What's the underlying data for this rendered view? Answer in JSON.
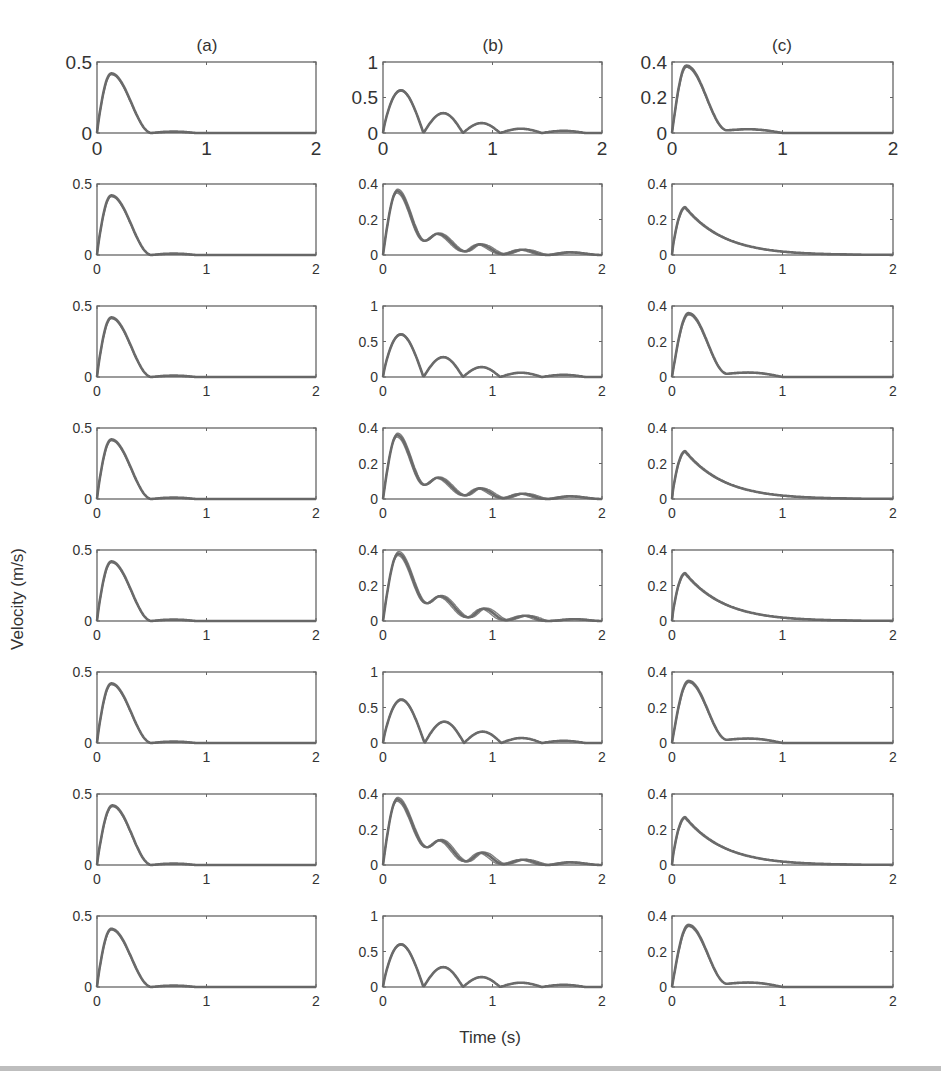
{
  "figure": {
    "column_titles": [
      "(a)",
      "(b)",
      "(c)"
    ],
    "ylabel": "Velocity (m/s)",
    "xlabel": "Time (s)",
    "line_color": "#6b6b6b",
    "axis_color": "#666666",
    "tick_label_color": "#333333"
  },
  "chart_data": {
    "type": "line",
    "layout": "8 rows x 3 columns of small multiples; each panel shows several overlapping velocity traces",
    "xlabel": "Time (s)",
    "ylabel": "Velocity (m/s)",
    "column_titles": [
      "(a)",
      "(b)",
      "(c)"
    ],
    "xlim": [
      0,
      2
    ],
    "xticks": [
      0,
      1,
      2
    ],
    "grid": false,
    "legend": null,
    "panels": [
      {
        "row": 1,
        "col": "a",
        "ylim": [
          0,
          0.5
        ],
        "yticks": [
          0,
          0.5
        ],
        "shape": "single_peak",
        "peak_t": 0.13,
        "peak_v": 0.42,
        "end_t": 0.5,
        "bump_v": 0.01
      },
      {
        "row": 1,
        "col": "b",
        "ylim": [
          0,
          1
        ],
        "yticks": [
          0,
          0.5,
          1
        ],
        "shape": "bouncing",
        "peaks": [
          [
            0.18,
            0.6
          ],
          [
            0.55,
            0.28
          ],
          [
            0.9,
            0.14
          ],
          [
            1.27,
            0.06
          ],
          [
            1.65,
            0.03
          ]
        ],
        "zeros": [
          0,
          0.37,
          0.73,
          1.07,
          1.45,
          1.85
        ]
      },
      {
        "row": 1,
        "col": "c",
        "ylim": [
          0,
          0.4
        ],
        "yticks": [
          0,
          0.2,
          0.4
        ],
        "shape": "peak_with_shoulder",
        "peak_t": 0.13,
        "peak_v": 0.38,
        "shoulder_t": 0.65,
        "shoulder_v": 0.025,
        "end_t": 1.0
      },
      {
        "row": 2,
        "col": "a",
        "ylim": [
          0,
          0.5
        ],
        "yticks": [
          0,
          0.5
        ],
        "shape": "single_peak",
        "peak_t": 0.13,
        "peak_v": 0.42,
        "end_t": 0.5,
        "bump_v": 0.01
      },
      {
        "row": 2,
        "col": "b",
        "ylim": [
          0,
          0.4
        ],
        "yticks": [
          0,
          0.2,
          0.4
        ],
        "shape": "damped_oscillation",
        "peaks": [
          [
            0.13,
            0.36
          ],
          [
            0.5,
            0.12
          ],
          [
            0.88,
            0.06
          ],
          [
            1.27,
            0.03
          ],
          [
            1.7,
            0.015
          ]
        ],
        "troughs": [
          [
            0.38,
            0.08
          ],
          [
            0.75,
            0.02
          ],
          [
            1.1,
            0.005
          ],
          [
            1.5,
            0.0
          ]
        ]
      },
      {
        "row": 2,
        "col": "c",
        "ylim": [
          0,
          0.4
        ],
        "yticks": [
          0,
          0.2,
          0.4
        ],
        "shape": "decay_tail",
        "peak_t": 0.12,
        "peak_v": 0.27,
        "tail_end_t": 1.3
      },
      {
        "row": 3,
        "col": "a",
        "ylim": [
          0,
          0.5
        ],
        "yticks": [
          0,
          0.5
        ],
        "shape": "single_peak",
        "peak_t": 0.13,
        "peak_v": 0.42,
        "end_t": 0.5,
        "bump_v": 0.01
      },
      {
        "row": 3,
        "col": "b",
        "ylim": [
          0,
          1
        ],
        "yticks": [
          0,
          0.5,
          1
        ],
        "shape": "bouncing",
        "peaks": [
          [
            0.18,
            0.6
          ],
          [
            0.55,
            0.28
          ],
          [
            0.9,
            0.14
          ],
          [
            1.27,
            0.06
          ],
          [
            1.65,
            0.03
          ]
        ],
        "zeros": [
          0,
          0.37,
          0.73,
          1.07,
          1.45,
          1.85
        ]
      },
      {
        "row": 3,
        "col": "c",
        "ylim": [
          0,
          0.4
        ],
        "yticks": [
          0,
          0.2,
          0.4
        ],
        "shape": "peak_with_shoulder",
        "peak_t": 0.15,
        "peak_v": 0.36,
        "shoulder_t": 0.65,
        "shoulder_v": 0.03,
        "end_t": 1.0
      },
      {
        "row": 4,
        "col": "a",
        "ylim": [
          0,
          0.5
        ],
        "yticks": [
          0,
          0.5
        ],
        "shape": "single_peak",
        "peak_t": 0.13,
        "peak_v": 0.42,
        "end_t": 0.5,
        "bump_v": 0.01
      },
      {
        "row": 4,
        "col": "b",
        "ylim": [
          0,
          0.4
        ],
        "yticks": [
          0,
          0.2,
          0.4
        ],
        "shape": "damped_oscillation",
        "peaks": [
          [
            0.13,
            0.36
          ],
          [
            0.5,
            0.12
          ],
          [
            0.88,
            0.06
          ],
          [
            1.27,
            0.03
          ],
          [
            1.7,
            0.015
          ]
        ],
        "troughs": [
          [
            0.38,
            0.08
          ],
          [
            0.75,
            0.02
          ],
          [
            1.1,
            0.005
          ],
          [
            1.5,
            0.0
          ]
        ]
      },
      {
        "row": 4,
        "col": "c",
        "ylim": [
          0,
          0.4
        ],
        "yticks": [
          0,
          0.2,
          0.4
        ],
        "shape": "decay_tail",
        "peak_t": 0.12,
        "peak_v": 0.27,
        "tail_end_t": 1.3
      },
      {
        "row": 5,
        "col": "a",
        "ylim": [
          0,
          0.5
        ],
        "yticks": [
          0,
          0.5
        ],
        "shape": "single_peak",
        "peak_t": 0.13,
        "peak_v": 0.42,
        "end_t": 0.5,
        "bump_v": 0.01
      },
      {
        "row": 5,
        "col": "b",
        "ylim": [
          0,
          0.4
        ],
        "yticks": [
          0,
          0.2,
          0.4
        ],
        "shape": "damped_oscillation",
        "peaks": [
          [
            0.14,
            0.38
          ],
          [
            0.52,
            0.14
          ],
          [
            0.92,
            0.07
          ],
          [
            1.3,
            0.03
          ],
          [
            1.75,
            0.01
          ]
        ],
        "troughs": [
          [
            0.4,
            0.1
          ],
          [
            0.78,
            0.02
          ],
          [
            1.12,
            0.005
          ],
          [
            1.5,
            0.0
          ]
        ]
      },
      {
        "row": 5,
        "col": "c",
        "ylim": [
          0,
          0.4
        ],
        "yticks": [
          0,
          0.2,
          0.4
        ],
        "shape": "decay_tail",
        "peak_t": 0.12,
        "peak_v": 0.27,
        "tail_end_t": 1.3
      },
      {
        "row": 6,
        "col": "a",
        "ylim": [
          0,
          0.5
        ],
        "yticks": [
          0,
          0.5
        ],
        "shape": "single_peak",
        "peak_t": 0.13,
        "peak_v": 0.42,
        "end_t": 0.5,
        "bump_v": 0.01
      },
      {
        "row": 6,
        "col": "b",
        "ylim": [
          0,
          1
        ],
        "yticks": [
          0,
          0.5,
          1
        ],
        "shape": "bouncing",
        "peaks": [
          [
            0.18,
            0.61
          ],
          [
            0.55,
            0.3
          ],
          [
            0.9,
            0.16
          ],
          [
            1.27,
            0.07
          ],
          [
            1.65,
            0.03
          ]
        ],
        "zeros": [
          0,
          0.38,
          0.74,
          1.08,
          1.45,
          1.85
        ]
      },
      {
        "row": 6,
        "col": "c",
        "ylim": [
          0,
          0.4
        ],
        "yticks": [
          0,
          0.2,
          0.4
        ],
        "shape": "peak_with_shoulder",
        "peak_t": 0.15,
        "peak_v": 0.35,
        "shoulder_t": 0.68,
        "shoulder_v": 0.03,
        "end_t": 1.0
      },
      {
        "row": 7,
        "col": "a",
        "ylim": [
          0,
          0.5
        ],
        "yticks": [
          0,
          0.5
        ],
        "shape": "single_peak",
        "peak_t": 0.14,
        "peak_v": 0.42,
        "end_t": 0.5,
        "bump_v": 0.01
      },
      {
        "row": 7,
        "col": "b",
        "ylim": [
          0,
          0.4
        ],
        "yticks": [
          0,
          0.2,
          0.4
        ],
        "shape": "damped_oscillation",
        "peaks": [
          [
            0.13,
            0.37
          ],
          [
            0.52,
            0.14
          ],
          [
            0.9,
            0.07
          ],
          [
            1.28,
            0.03
          ],
          [
            1.7,
            0.015
          ]
        ],
        "troughs": [
          [
            0.4,
            0.1
          ],
          [
            0.76,
            0.02
          ],
          [
            1.1,
            0.005
          ],
          [
            1.5,
            0.0
          ]
        ]
      },
      {
        "row": 7,
        "col": "c",
        "ylim": [
          0,
          0.4
        ],
        "yticks": [
          0,
          0.2,
          0.4
        ],
        "shape": "decay_tail",
        "peak_t": 0.12,
        "peak_v": 0.27,
        "tail_end_t": 1.3
      },
      {
        "row": 8,
        "col": "a",
        "ylim": [
          0,
          0.5
        ],
        "yticks": [
          0,
          0.5
        ],
        "shape": "single_peak",
        "peak_t": 0.13,
        "peak_v": 0.41,
        "end_t": 0.5,
        "bump_v": 0.01
      },
      {
        "row": 8,
        "col": "b",
        "ylim": [
          0,
          1
        ],
        "yticks": [
          0,
          0.5,
          1
        ],
        "shape": "bouncing",
        "peaks": [
          [
            0.18,
            0.6
          ],
          [
            0.55,
            0.28
          ],
          [
            0.9,
            0.14
          ],
          [
            1.27,
            0.06
          ],
          [
            1.65,
            0.03
          ]
        ],
        "zeros": [
          0,
          0.37,
          0.73,
          1.07,
          1.45,
          1.85
        ]
      },
      {
        "row": 8,
        "col": "c",
        "ylim": [
          0,
          0.4
        ],
        "yticks": [
          0,
          0.2,
          0.4
        ],
        "shape": "peak_with_shoulder",
        "peak_t": 0.15,
        "peak_v": 0.35,
        "shoulder_t": 0.68,
        "shoulder_v": 0.03,
        "end_t": 1.0
      }
    ]
  }
}
